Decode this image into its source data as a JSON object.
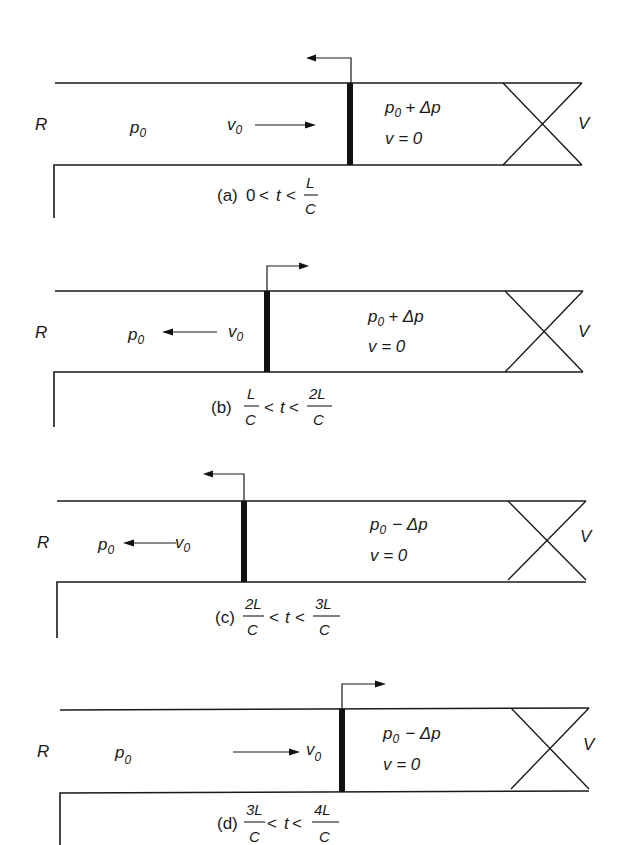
{
  "figure": {
    "labels": {
      "reservoir": "R",
      "valve": "V"
    },
    "panels": [
      {
        "id": "a",
        "caption_prefix": "(a)",
        "caption_lower": "0",
        "caption_op": "<",
        "caption_var": "t",
        "caption_upper_num": "L",
        "caption_upper_den": "C",
        "upstream_pressure": "p0",
        "upstream_velocity": "v0",
        "velocity_direction": "right",
        "downstream_pressure": "p0 + Δp",
        "downstream_velocity": "v = 0",
        "wave_direction": "left",
        "wave_position": "mid"
      },
      {
        "id": "b",
        "caption_prefix": "(b)",
        "caption_lower_num": "L",
        "caption_lower_den": "C",
        "caption_var": "t",
        "caption_upper_num": "2L",
        "caption_upper_den": "C",
        "upstream_pressure": "p0",
        "upstream_velocity": "v0",
        "velocity_direction": "left",
        "downstream_pressure": "p0 + Δp",
        "downstream_velocity": "v = 0",
        "wave_direction": "right"
      },
      {
        "id": "c",
        "caption_prefix": "(c)",
        "caption_lower_num": "2L",
        "caption_lower_den": "C",
        "caption_var": "t",
        "caption_upper_num": "3L",
        "caption_upper_den": "C",
        "upstream_pressure": "p0",
        "upstream_velocity": "v0",
        "velocity_direction": "left",
        "downstream_pressure": "p0 − Δp",
        "downstream_velocity": "v = 0",
        "wave_direction": "left"
      },
      {
        "id": "d",
        "caption_prefix": "(d)",
        "caption_lower_num": "3L",
        "caption_lower_den": "C",
        "caption_var": "t",
        "caption_upper_num": "4L",
        "caption_upper_den": "C",
        "upstream_pressure": "p0",
        "upstream_velocity": "v0",
        "velocity_direction": "right",
        "downstream_pressure": "p0 − Δp",
        "downstream_velocity": "v = 0",
        "wave_direction": "right"
      }
    ],
    "text": {
      "p": "p",
      "sub0": "0",
      "v": "v",
      "plus_dp": "+ Δp",
      "minus_dp": "− Δp",
      "v_eq_0": "v = 0",
      "lt": "<",
      "t": "t",
      "zero": "0"
    }
  }
}
